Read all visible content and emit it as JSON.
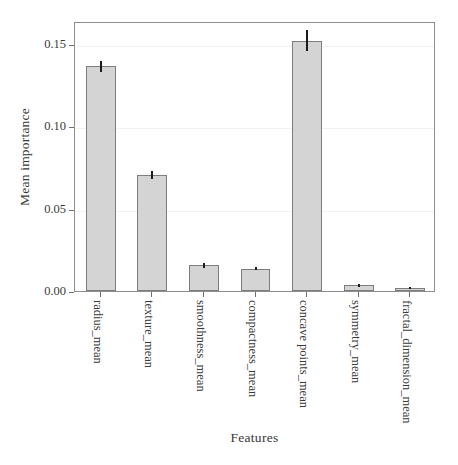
{
  "chart_data": {
    "type": "bar",
    "title": "",
    "xlabel": "Features",
    "ylabel": "Mean importance",
    "categories": [
      "radius_mean",
      "texture_mean",
      "smoothness_mean",
      "compactness_mean",
      "concave points_mean",
      "symmetry_mean",
      "fractal_dimension_mean"
    ],
    "values": [
      0.1365,
      0.0705,
      0.0155,
      0.0135,
      0.152,
      0.0035,
      0.002
    ],
    "errors": [
      0.0035,
      0.0025,
      0.0015,
      0.001,
      0.0065,
      0.0008,
      0.0005
    ],
    "ylim": [
      0.0,
      0.164
    ],
    "xlim": [
      0,
      7
    ],
    "yticks": [
      0.0,
      0.05,
      0.1,
      0.15
    ],
    "ytick_labels": [
      "0.00",
      "0.05",
      "0.10",
      "0.15"
    ],
    "grid": true,
    "grid_axis": "y",
    "legend": "none",
    "bar_color": "#d4d4d4",
    "bar_edge_color": "#7d7d7d",
    "error_color": "#1b1b1b",
    "frame_color": "#8d8d8d",
    "background": "#ffffff"
  }
}
